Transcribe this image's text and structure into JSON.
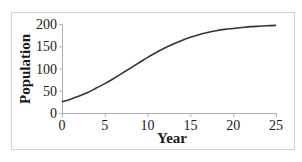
{
  "chart_data": {
    "type": "line",
    "title": "",
    "xlabel": "Year",
    "ylabel": "Population",
    "xlim": [
      0,
      25
    ],
    "ylim": [
      0,
      200
    ],
    "xticks": [
      0,
      5,
      10,
      15,
      20,
      25
    ],
    "yticks": [
      0,
      50,
      100,
      150,
      200
    ],
    "grid": false,
    "legend": null,
    "series": [
      {
        "name": "Population",
        "color": "#333333",
        "x": [
          0,
          1,
          2,
          3,
          4,
          5,
          6,
          7,
          8,
          9,
          10,
          11,
          12,
          13,
          14,
          15,
          16,
          17,
          18,
          19,
          20,
          21,
          22,
          23,
          24,
          25
        ],
        "values": [
          25,
          31,
          38,
          46,
          56,
          66,
          77,
          89,
          101,
          113,
          125,
          136,
          146,
          155,
          163,
          170,
          176,
          181,
          185,
          188,
          190,
          192,
          194,
          195,
          196,
          197
        ]
      }
    ]
  },
  "colors": {
    "frame": "#d0d0d0",
    "axis": "#b0b0b0",
    "curve": "#333333",
    "text": "#1a1a1a"
  }
}
